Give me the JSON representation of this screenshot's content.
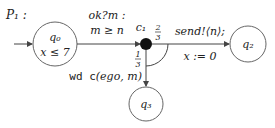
{
  "diagram": {
    "title": "P₁ :",
    "states": [
      {
        "id": "q0",
        "label": "q₀",
        "invariant": "x ≤ 7",
        "initial": true
      },
      {
        "id": "q2",
        "label": "q₂"
      },
      {
        "id": "q3",
        "label": "q₃"
      }
    ],
    "branch_node": {
      "id": "c1",
      "label": "c₁"
    },
    "edges": [
      {
        "from": "q0",
        "to": "c1",
        "label_line1": "ok?m :",
        "label_line2": "m ≥ n"
      },
      {
        "from": "c1",
        "to": "q2",
        "prob_num": "2",
        "prob_den": "3",
        "label_line1": "send!⟨n⟩;",
        "label_line2": "x := 0"
      },
      {
        "from": "c1",
        "to": "q3",
        "prob_num": "1",
        "prob_den": "3",
        "label_prefix": "wd c",
        "label_args": "(ego, m)"
      }
    ]
  }
}
